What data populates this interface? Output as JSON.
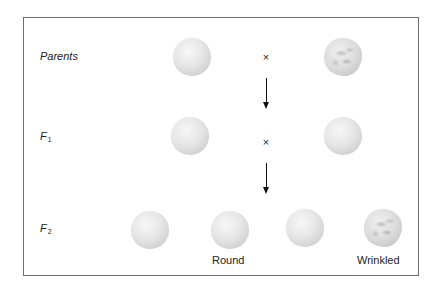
{
  "diagram": {
    "generations": [
      {
        "label": "Parents",
        "sub": "",
        "cross_symbol": "×"
      },
      {
        "label": "F",
        "sub": "1",
        "cross_symbol": "×"
      },
      {
        "label": "F",
        "sub": "2",
        "cross_symbol": ""
      }
    ],
    "peas": {
      "parents": [
        "round",
        "wrinkled"
      ],
      "f1": [
        "round",
        "round"
      ],
      "f2": [
        "round",
        "round",
        "round",
        "wrinkled"
      ]
    },
    "phenotype_labels": {
      "round": "Round",
      "wrinkled": "Wrinkled"
    },
    "colors": {
      "frame": "#6e6e6e",
      "pea_light": "#f7f7f7",
      "pea_dark": "#b9b9b9",
      "text": "#222222"
    }
  }
}
